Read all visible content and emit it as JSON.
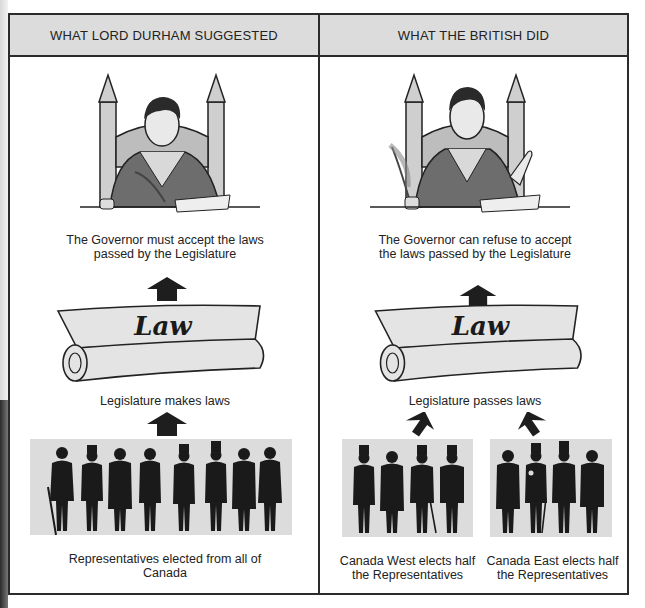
{
  "headers": {
    "left": "WHAT LORD DURHAM SUGGESTED",
    "right": "WHAT THE BRITISH DID"
  },
  "left_panel": {
    "governor_illustration": "governor-writing-with-quill",
    "governor_caption": "The Governor must accept the laws passed by the Legislature",
    "scroll_label": "Law",
    "legislature_caption": "Legislature makes laws",
    "representatives_count": 8,
    "representatives_caption": "Representatives elected from all of Canada"
  },
  "right_panel": {
    "governor_illustration": "governor-refusing-gesture",
    "governor_caption": "The Governor can refuse to accept the laws passed by the Legislature",
    "scroll_label": "Law",
    "legislature_caption": "Legislature passes laws",
    "groups": [
      {
        "name": "Canada West",
        "representatives_count": 4,
        "caption": "Canada West elects half the Representatives"
      },
      {
        "name": "Canada East",
        "representatives_count": 4,
        "caption": "Canada East elects half the Representatives"
      }
    ]
  },
  "colors": {
    "border": "#2b2b2b",
    "header_bg": "#dcdcdc",
    "box_bg": "#dcdcdc",
    "silhouette": "#1a1a1a",
    "scroll_fill": "#e4e4e4"
  }
}
